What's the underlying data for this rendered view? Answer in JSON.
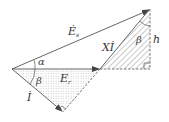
{
  "diagram": {
    "type": "phasor-diagram",
    "labels": {
      "Es": "Ė",
      "Es_sub": "s",
      "Er": "E",
      "Er_sub": "r",
      "I": "İ",
      "XI": "Xİ",
      "alpha": "α",
      "beta_left": "β",
      "beta_right": "β",
      "h": "h"
    },
    "colors": {
      "line": "#555555",
      "hatch": "#777777",
      "dots": "#999999"
    }
  }
}
